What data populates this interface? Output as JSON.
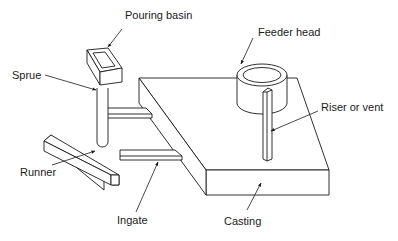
{
  "diagram": {
    "line_color": "#1a1a1a",
    "background": "#ffffff",
    "labels": {
      "pouring_basin": "Pouring basin",
      "sprue": "Sprue",
      "feeder_head": "Feeder head",
      "riser_or_vent": "Riser or vent",
      "runner": "Runner",
      "ingate": "Ingate",
      "casting": "Casting"
    }
  }
}
